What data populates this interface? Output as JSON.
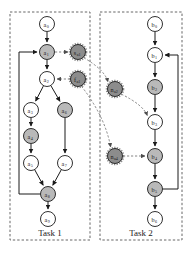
{
  "figure": {
    "type": "task-precedence-graph",
    "background": "#ffffff"
  },
  "colors": {
    "node_white": "#ffffff",
    "node_gray": "#b9b9b9",
    "node_dark": "#8c8c8c",
    "stroke": "#1a1a1a",
    "box_dashed": "#555555",
    "edge_solid": "#1a1a1a",
    "edge_dashed": "#777777"
  },
  "boxes": [
    {
      "id": "task1",
      "label": "Task 1",
      "x": 10,
      "y": 12,
      "w": 80,
      "h": 228,
      "label_x": 50,
      "label_y": 236
    },
    {
      "id": "task2",
      "label": "Task 2",
      "x": 100,
      "y": 12,
      "w": 82,
      "h": 228,
      "label_x": 141,
      "label_y": 236
    }
  ],
  "nodes": [
    {
      "id": "a0",
      "base": "a",
      "sub": "0",
      "x": 47,
      "y": 24,
      "r": 7.5,
      "fill": "node_white",
      "task": "task1"
    },
    {
      "id": "a1",
      "base": "a",
      "sub": "1",
      "x": 47,
      "y": 52,
      "r": 7.5,
      "fill": "node_gray",
      "task": "task1"
    },
    {
      "id": "a2",
      "base": "a",
      "sub": "2",
      "x": 47,
      "y": 79,
      "r": 7.5,
      "fill": "node_white",
      "task": "task1"
    },
    {
      "id": "a3",
      "base": "a",
      "sub": "3",
      "x": 31,
      "y": 110,
      "r": 7.5,
      "fill": "node_white",
      "task": "task1"
    },
    {
      "id": "a4",
      "base": "a",
      "sub": "4",
      "x": 31,
      "y": 136,
      "r": 7.5,
      "fill": "node_gray",
      "task": "task1"
    },
    {
      "id": "a5",
      "base": "a",
      "sub": "5",
      "x": 31,
      "y": 163,
      "r": 7.5,
      "fill": "node_white",
      "task": "task1"
    },
    {
      "id": "a6",
      "base": "a",
      "sub": "6",
      "x": 65,
      "y": 110,
      "r": 7.5,
      "fill": "node_gray",
      "task": "task1"
    },
    {
      "id": "a7",
      "base": "a",
      "sub": "7",
      "x": 65,
      "y": 163,
      "r": 7.5,
      "fill": "node_white",
      "task": "task1"
    },
    {
      "id": "a8",
      "base": "a",
      "sub": "8",
      "x": 48,
      "y": 194,
      "r": 7.5,
      "fill": "node_gray",
      "task": "task1"
    },
    {
      "id": "a9",
      "base": "a",
      "sub": "9",
      "x": 48,
      "y": 219,
      "r": 7.5,
      "fill": "node_white",
      "task": "task1"
    },
    {
      "id": "sa1",
      "base": "s",
      "sub": "a1",
      "x": 78,
      "y": 52,
      "r": 7.5,
      "fill": "node_dark",
      "task": "sync"
    },
    {
      "id": "fa1",
      "base": "f",
      "sub": "a1",
      "x": 78,
      "y": 79,
      "r": 7.5,
      "fill": "node_dark",
      "task": "sync"
    },
    {
      "id": "b0",
      "base": "b",
      "sub": "0",
      "x": 155,
      "y": 24,
      "r": 7.5,
      "fill": "node_white",
      "task": "task2"
    },
    {
      "id": "b1",
      "base": "b",
      "sub": "1",
      "x": 155,
      "y": 55,
      "r": 7.5,
      "fill": "node_white",
      "task": "task2"
    },
    {
      "id": "b2",
      "base": "b",
      "sub": "2",
      "x": 155,
      "y": 87,
      "r": 7.5,
      "fill": "node_gray",
      "task": "task2"
    },
    {
      "id": "b3",
      "base": "b",
      "sub": "3",
      "x": 155,
      "y": 122,
      "r": 7.5,
      "fill": "node_white",
      "task": "task2"
    },
    {
      "id": "b4",
      "base": "b",
      "sub": "4",
      "x": 155,
      "y": 156,
      "r": 7.5,
      "fill": "node_gray",
      "task": "task2"
    },
    {
      "id": "b5",
      "base": "b",
      "sub": "5",
      "x": 155,
      "y": 189,
      "r": 7.5,
      "fill": "node_gray",
      "task": "task2"
    },
    {
      "id": "b6",
      "base": "b",
      "sub": "6",
      "x": 155,
      "y": 219,
      "r": 7.5,
      "fill": "node_white",
      "task": "task2"
    },
    {
      "id": "na2",
      "base": "n",
      "sub": "a2",
      "x": 115,
      "y": 89,
      "r": 7.5,
      "fill": "node_dark",
      "task": "sync"
    },
    {
      "id": "na4",
      "base": "n",
      "sub": "a4",
      "x": 115,
      "y": 156,
      "r": 7.5,
      "fill": "node_dark",
      "task": "sync"
    }
  ],
  "edges_solid": [
    {
      "from": "a0",
      "to": "a1"
    },
    {
      "from": "a1",
      "to": "a2"
    },
    {
      "from": "a2",
      "to": "a3"
    },
    {
      "from": "a2",
      "to": "a6"
    },
    {
      "from": "a3",
      "to": "a4"
    },
    {
      "from": "a4",
      "to": "a5"
    },
    {
      "from": "a6",
      "to": "a7"
    },
    {
      "from": "a5",
      "to": "a8"
    },
    {
      "from": "a7",
      "to": "a8"
    },
    {
      "from": "a8",
      "to": "a9"
    },
    {
      "from": "b0",
      "to": "b1"
    },
    {
      "from": "b1",
      "to": "b2"
    },
    {
      "from": "b2",
      "to": "b3"
    },
    {
      "from": "b3",
      "to": "b4"
    },
    {
      "from": "b4",
      "to": "b5"
    },
    {
      "from": "b5",
      "to": "b6"
    }
  ],
  "edges_feedback": [
    {
      "id": "a8-to-a1",
      "from": "a8",
      "to": "a1",
      "note": "loop-back left side of task 1"
    },
    {
      "id": "b5-to-b1",
      "from": "b5",
      "to": "b1",
      "note": "loop-back right side of task 2"
    }
  ],
  "edges_dashed": [
    {
      "from": "a1",
      "to": "sa1"
    },
    {
      "from": "fa1",
      "to": "a2"
    },
    {
      "from": "na2",
      "to": "b3"
    },
    {
      "from": "na4",
      "to": "b4"
    },
    {
      "from": "sa1",
      "to": "na2"
    },
    {
      "from": "fa1",
      "to": "na4"
    }
  ]
}
